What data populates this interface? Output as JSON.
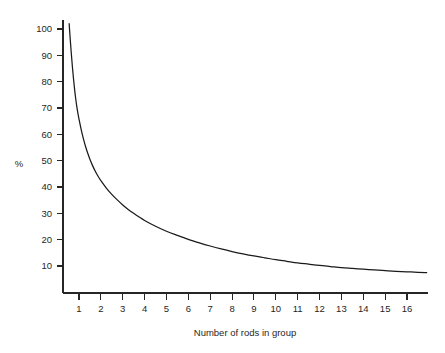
{
  "chart_data": {
    "type": "line",
    "title": "",
    "xlabel": "Number of rods in group",
    "ylabel": "%",
    "xlim": [
      0.5,
      16.9
    ],
    "ylim": [
      0,
      104
    ],
    "grid": false,
    "legend": null,
    "x_ticks": [
      1,
      2,
      3,
      4,
      5,
      6,
      7,
      8,
      9,
      10,
      11,
      12,
      13,
      14,
      15,
      16
    ],
    "x_tick_labels": [
      "1",
      "2",
      "3",
      "4",
      "5",
      "6",
      "7",
      "8",
      "9",
      "10",
      "11",
      "12",
      "13",
      "14",
      "15",
      "16"
    ],
    "y_ticks": [
      10,
      20,
      30,
      40,
      50,
      60,
      70,
      80,
      90,
      100
    ],
    "y_tick_labels": [
      "10",
      "20",
      "30",
      "40",
      "50",
      "60",
      "70",
      "80",
      "90",
      "100"
    ],
    "series": [
      {
        "name": "percent",
        "color": "#1a1a1a",
        "x": [
          0.55,
          0.6,
          0.65,
          0.7,
          0.75,
          0.8,
          0.85,
          0.9,
          0.95,
          1.0,
          1.1,
          1.2,
          1.3,
          1.4,
          1.5,
          1.6,
          1.75,
          1.9,
          2.0,
          2.25,
          2.5,
          2.75,
          3.0,
          3.25,
          3.5,
          3.75,
          4.0,
          4.5,
          5.0,
          5.5,
          6.0,
          6.5,
          7.0,
          7.5,
          8.0,
          8.5,
          9.0,
          9.5,
          10.0,
          10.5,
          11.0,
          11.5,
          12.0,
          12.5,
          13.0,
          13.5,
          14.0,
          14.5,
          15.0,
          15.5,
          16.0,
          16.5,
          16.9
        ],
        "y": [
          102.0,
          96.0,
          90.5,
          85.5,
          81.0,
          77.0,
          73.5,
          70.5,
          68.0,
          65.8,
          61.8,
          58.4,
          55.4,
          52.8,
          50.5,
          48.5,
          45.9,
          43.7,
          42.4,
          39.6,
          37.2,
          35.1,
          33.2,
          31.5,
          30.0,
          28.6,
          27.3,
          25.1,
          23.2,
          21.6,
          20.1,
          18.8,
          17.6,
          16.5,
          15.5,
          14.6,
          13.8,
          13.1,
          12.4,
          11.8,
          11.2,
          10.7,
          10.2,
          9.8,
          9.4,
          9.1,
          8.8,
          8.5,
          8.2,
          8.0,
          7.8,
          7.6,
          7.5
        ]
      }
    ],
    "annotations": []
  },
  "axes": {
    "y_axis_title": "%",
    "x_axis_title": "Number of rods in group"
  }
}
